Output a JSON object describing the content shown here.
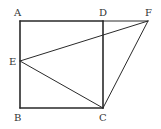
{
  "diagram": {
    "type": "geometry",
    "stroke_color": "#2a2a2a",
    "label_color": "#333333",
    "background": "#ffffff",
    "points": {
      "A": {
        "label": "A",
        "x": 20,
        "y": 21
      },
      "B": {
        "label": "B",
        "x": 20,
        "y": 108
      },
      "C": {
        "label": "C",
        "x": 103,
        "y": 108
      },
      "D": {
        "label": "D",
        "x": 103,
        "y": 21
      },
      "E": {
        "label": "E",
        "x": 20,
        "y": 61
      },
      "F": {
        "label": "F",
        "x": 148,
        "y": 21
      }
    },
    "labels": {
      "A": "A",
      "B": "B",
      "C": "C",
      "D": "D",
      "E": "E",
      "F": "F"
    },
    "segments": [
      {
        "from": "A",
        "to": "D",
        "name": "AD"
      },
      {
        "from": "D",
        "to": "F",
        "name": "DF"
      },
      {
        "from": "A",
        "to": "B",
        "name": "AB"
      },
      {
        "from": "B",
        "to": "C",
        "name": "BC"
      },
      {
        "from": "D",
        "to": "C",
        "name": "DC"
      },
      {
        "from": "E",
        "to": "F",
        "name": "EF"
      },
      {
        "from": "E",
        "to": "C",
        "name": "EC"
      },
      {
        "from": "C",
        "to": "F",
        "name": "CF"
      }
    ],
    "shapes": [
      "square ABCD",
      "triangle ECF"
    ]
  }
}
